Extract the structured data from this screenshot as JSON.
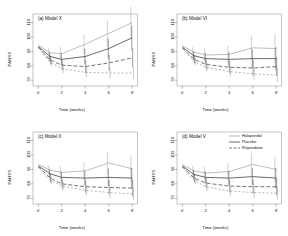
{
  "figure": {
    "layout": "2x2 grid of line charts",
    "shared": {
      "xlabel": "Time (weeks)",
      "ylabel": "PANSS",
      "xticks": [
        "0",
        "2",
        "4",
        "6",
        "8"
      ],
      "xtick_values": [
        0,
        2,
        4,
        6,
        8
      ]
    },
    "legend": {
      "position": "top-right of panel (d)",
      "entries": [
        {
          "label": "Haloperidol",
          "style": "solid-gray",
          "color": "#8e8e8e"
        },
        {
          "label": "Placebo",
          "style": "solid-black",
          "color": "#1a1a1a"
        },
        {
          "label": "Risperidone",
          "style": "dashed-dotted",
          "color": "#2b2b2b"
        }
      ]
    }
  },
  "chart_data": [
    {
      "type": "line",
      "panel": "a",
      "title": "(a) Model X",
      "xlabel": "Time (weeks)",
      "ylabel": "PANSS",
      "x": [
        0,
        1,
        2,
        4,
        6,
        8
      ],
      "xlim": [
        -0.45,
        8.45
      ],
      "ylim": [
        66,
        116
      ],
      "yticks": [
        70,
        80,
        90,
        100,
        110
      ],
      "ytick_labels": [
        "70",
        "80",
        "90",
        "100",
        "110"
      ],
      "grid": false,
      "legend": false,
      "series": [
        {
          "name": "Haloperidol",
          "values": [
            94.5,
            89.0,
            88.5,
            95.0,
            102.5,
            110.0
          ],
          "errors": [
            3.0,
            3.5,
            4.5,
            6.5,
            9.0,
            11.0
          ],
          "color": "#9a9a9a",
          "dash": "none"
        },
        {
          "name": "Placebo",
          "values": [
            93.5,
            86.5,
            84.5,
            86.5,
            92.0,
            99.5
          ],
          "errors": [
            2.5,
            3.0,
            4.0,
            5.5,
            7.0,
            8.5
          ],
          "color": "#1a1a1a",
          "dash": "none"
        },
        {
          "name": "Risperidone",
          "values": [
            93.0,
            84.0,
            80.5,
            79.5,
            82.0,
            85.5
          ],
          "errors": [
            2.5,
            3.0,
            3.5,
            4.5,
            5.5,
            6.5
          ],
          "color": "#2b2b2b",
          "dash": "4,2"
        },
        {
          "name": "Risperidone-low",
          "values": [
            92.5,
            82.5,
            78.0,
            75.5,
            75.0,
            75.0
          ],
          "errors": [
            2.0,
            2.5,
            3.0,
            3.5,
            4.0,
            4.5
          ],
          "color": "#8c8c8c",
          "dash": "2,2"
        }
      ]
    },
    {
      "type": "line",
      "panel": "b",
      "title": "(b) Model VI",
      "xlabel": "Time (weeks)",
      "ylabel": "PANSS",
      "x": [
        0,
        1,
        2,
        4,
        6,
        8
      ],
      "xlim": [
        -0.45,
        8.45
      ],
      "ylim": [
        66,
        116
      ],
      "yticks": [
        70,
        80,
        90,
        100,
        110
      ],
      "ytick_labels": [
        "70",
        "80",
        "90",
        "100",
        "110"
      ],
      "grid": false,
      "legend": false,
      "series": [
        {
          "name": "Haloperidol",
          "values": [
            94.0,
            89.5,
            87.5,
            88.0,
            92.5,
            92.0
          ],
          "errors": [
            3.0,
            3.5,
            4.5,
            6.0,
            8.5,
            10.5
          ],
          "color": "#9a9a9a",
          "dash": "none"
        },
        {
          "name": "Placebo",
          "values": [
            93.0,
            87.0,
            85.0,
            84.5,
            85.0,
            85.0
          ],
          "errors": [
            2.5,
            3.0,
            4.0,
            5.0,
            6.5,
            8.0
          ],
          "color": "#1a1a1a",
          "dash": "none"
        },
        {
          "name": "Risperidone",
          "values": [
            92.5,
            84.5,
            81.0,
            79.0,
            78.5,
            79.5
          ],
          "errors": [
            2.5,
            3.0,
            3.5,
            4.5,
            5.5,
            6.5
          ],
          "color": "#2b2b2b",
          "dash": "4,2"
        },
        {
          "name": "Risperidone-low",
          "values": [
            92.0,
            83.0,
            79.0,
            76.0,
            74.5,
            73.5
          ],
          "errors": [
            2.0,
            2.5,
            3.0,
            3.5,
            4.0,
            4.5
          ],
          "color": "#8c8c8c",
          "dash": "2,2"
        }
      ]
    },
    {
      "type": "line",
      "panel": "c",
      "title": "(c) Model II",
      "xlabel": "Time (weeks)",
      "ylabel": "PANSS",
      "x": [
        0,
        1,
        2,
        4,
        6,
        8
      ],
      "xlim": [
        -0.45,
        8.45
      ],
      "ylim": [
        66,
        116
      ],
      "yticks": [
        70,
        80,
        90,
        100,
        110
      ],
      "ytick_labels": [
        "70",
        "80",
        "90",
        "100",
        "110"
      ],
      "grid": false,
      "legend": false,
      "series": [
        {
          "name": "Haloperidol",
          "values": [
            93.5,
            89.5,
            88.0,
            89.0,
            94.5,
            90.5
          ],
          "errors": [
            3.0,
            3.5,
            4.5,
            6.0,
            8.0,
            9.0
          ],
          "color": "#9a9a9a",
          "dash": "none"
        },
        {
          "name": "Placebo",
          "values": [
            92.5,
            87.0,
            84.5,
            84.0,
            84.5,
            84.0
          ],
          "errors": [
            2.5,
            3.0,
            4.0,
            5.0,
            6.0,
            7.0
          ],
          "color": "#1a1a1a",
          "dash": "none"
        },
        {
          "name": "Risperidone",
          "values": [
            92.0,
            84.0,
            80.0,
            78.0,
            77.5,
            77.0
          ],
          "errors": [
            2.5,
            3.0,
            3.5,
            4.5,
            5.0,
            6.0
          ],
          "color": "#2b2b2b",
          "dash": "4,2"
        },
        {
          "name": "Risperidone-low",
          "values": [
            91.5,
            82.5,
            78.5,
            75.5,
            74.0,
            73.0
          ],
          "errors": [
            2.0,
            2.5,
            3.0,
            3.5,
            4.0,
            4.5
          ],
          "color": "#8c8c8c",
          "dash": "2,2"
        }
      ]
    },
    {
      "type": "line",
      "panel": "d",
      "title": "(d) Model V",
      "xlabel": "Time (weeks)",
      "ylabel": "PANSS",
      "x": [
        0,
        1,
        2,
        4,
        6,
        8
      ],
      "xlim": [
        -0.45,
        8.45
      ],
      "ylim": [
        66,
        116
      ],
      "yticks": [
        70,
        80,
        90,
        100,
        110
      ],
      "ytick_labels": [
        "70",
        "80",
        "90",
        "100",
        "110"
      ],
      "grid": false,
      "legend": true,
      "series": [
        {
          "name": "Haloperidol",
          "values": [
            93.5,
            89.0,
            87.5,
            88.5,
            93.5,
            90.0
          ],
          "errors": [
            3.0,
            3.5,
            4.5,
            6.0,
            8.0,
            9.0
          ],
          "color": "#9a9a9a",
          "dash": "none"
        },
        {
          "name": "Placebo",
          "values": [
            92.5,
            86.5,
            84.5,
            84.0,
            85.0,
            84.0
          ],
          "errors": [
            2.5,
            3.0,
            4.0,
            5.0,
            6.0,
            7.0
          ],
          "color": "#1a1a1a",
          "dash": "none"
        },
        {
          "name": "Risperidone",
          "values": [
            92.0,
            84.0,
            80.5,
            78.5,
            78.0,
            78.0
          ],
          "errors": [
            2.5,
            3.0,
            3.5,
            4.5,
            5.0,
            6.0
          ],
          "color": "#2b2b2b",
          "dash": "4,2"
        },
        {
          "name": "Risperidone-low",
          "values": [
            91.5,
            82.5,
            78.0,
            75.0,
            74.0,
            73.5
          ],
          "errors": [
            2.0,
            2.5,
            3.0,
            3.5,
            4.0,
            4.5
          ],
          "color": "#8c8c8c",
          "dash": "2,2"
        }
      ]
    }
  ]
}
